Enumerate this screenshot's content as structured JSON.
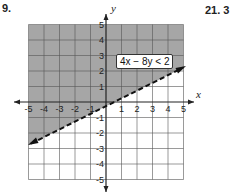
{
  "problem_left": {
    "number": "9."
  },
  "problem_right": {
    "number": "21. 3"
  },
  "graph": {
    "inequality_label": "4x − 8y < 2",
    "x_axis_label": "x",
    "y_axis_label": "y",
    "x_ticks": [
      "-5",
      "-4",
      "-3",
      "-2",
      "-1",
      "1",
      "2",
      "3",
      "4",
      "5"
    ],
    "y_ticks": [
      "5",
      "4",
      "3",
      "2",
      "1",
      "-1",
      "-2",
      "-3",
      "-4",
      "-5"
    ],
    "boundary": "dashed",
    "shaded_region": "above line",
    "shade_color": "#a6a6a6"
  }
}
